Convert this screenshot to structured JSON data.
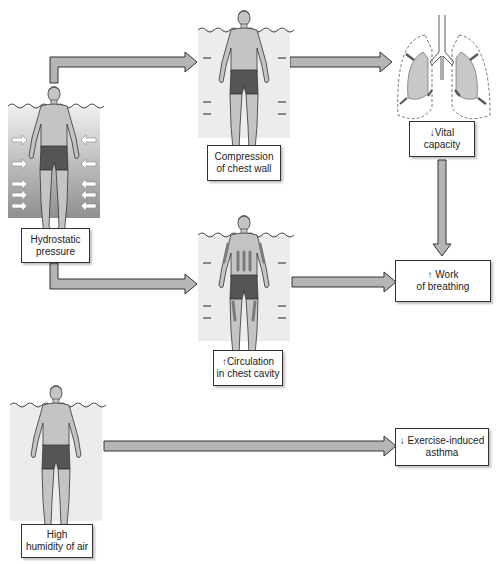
{
  "colors": {
    "arrow_fill": "#b5b5b5",
    "arrow_stroke": "#333333",
    "water_light": "#ececec",
    "water_dark": "#9a9a9a",
    "skin": "#c4c4c4",
    "shorts": "#555555",
    "lung_fill": "#c8c8c8",
    "stream": "#7a7a7a"
  },
  "nodes": {
    "hydrostatic": {
      "line1": "Hydrostatic",
      "line2": "pressure"
    },
    "compression": {
      "line1": "Compression",
      "line2": "of chest wall"
    },
    "vital": {
      "line1": "↓Vital",
      "line2": "capacity"
    },
    "circulation": {
      "line1": "↑Circulation",
      "line2": "in chest cavity"
    },
    "work": {
      "line1": "↑ Work",
      "line2": "of breathing"
    },
    "humidity": {
      "line1": "High",
      "line2": "humidity of air"
    },
    "asthma": {
      "line1": "↓ Exercise-induced",
      "line2": "asthma"
    }
  },
  "edges": [
    {
      "from": "hydrostatic",
      "to": "compression"
    },
    {
      "from": "compression",
      "to": "vital"
    },
    {
      "from": "vital",
      "to": "work"
    },
    {
      "from": "hydrostatic",
      "to": "circulation"
    },
    {
      "from": "circulation",
      "to": "work"
    },
    {
      "from": "humidity",
      "to": "asthma"
    }
  ]
}
